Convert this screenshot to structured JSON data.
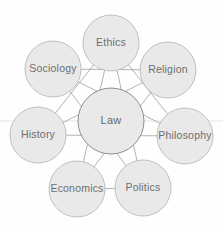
{
  "diagram": {
    "type": "radial-star-network",
    "canvas": {
      "width": 223,
      "height": 231,
      "background": "#fefefe"
    },
    "colors": {
      "node_fill": "#e9e9e9",
      "node_stroke": "#b9b9b9",
      "center_stroke": "#8e8e8e",
      "link_stroke": "#9a9a9a",
      "label_text": "#6e6e6e"
    },
    "center": {
      "label": "Law",
      "cx": 111,
      "cy": 121,
      "r": 33
    },
    "nodes": [
      {
        "id": "ethics",
        "label": "Ethics",
        "cx": 111,
        "cy": 43,
        "r": 28
      },
      {
        "id": "religion",
        "label": "Religion",
        "cx": 168,
        "cy": 70,
        "r": 28
      },
      {
        "id": "philosophy",
        "label": "Philosophy",
        "cx": 185,
        "cy": 136,
        "r": 28
      },
      {
        "id": "politics",
        "label": "Politics",
        "cx": 143,
        "cy": 188,
        "r": 28
      },
      {
        "id": "economics",
        "label": "Economics",
        "cx": 77,
        "cy": 189,
        "r": 28
      },
      {
        "id": "history",
        "label": "History",
        "cx": 38,
        "cy": 135,
        "r": 28
      },
      {
        "id": "sociology",
        "label": "Sociology",
        "cx": 53,
        "cy": 69,
        "r": 28
      }
    ],
    "links": [
      {
        "from": "ethics",
        "to": "politics"
      },
      {
        "from": "ethics",
        "to": "economics"
      },
      {
        "from": "religion",
        "to": "economics"
      },
      {
        "from": "religion",
        "to": "history"
      },
      {
        "from": "philosophy",
        "to": "history"
      },
      {
        "from": "philosophy",
        "to": "sociology"
      },
      {
        "from": "politics",
        "to": "sociology"
      },
      {
        "from": "sociology",
        "to": "religion"
      },
      {
        "from": "economics",
        "to": "politics"
      },
      {
        "from": "history",
        "to": "ethics"
      },
      {
        "from": "ethics",
        "to": "philosophy"
      }
    ],
    "artifact_line": {
      "y": 121,
      "x1": 0,
      "x2": 223
    }
  }
}
